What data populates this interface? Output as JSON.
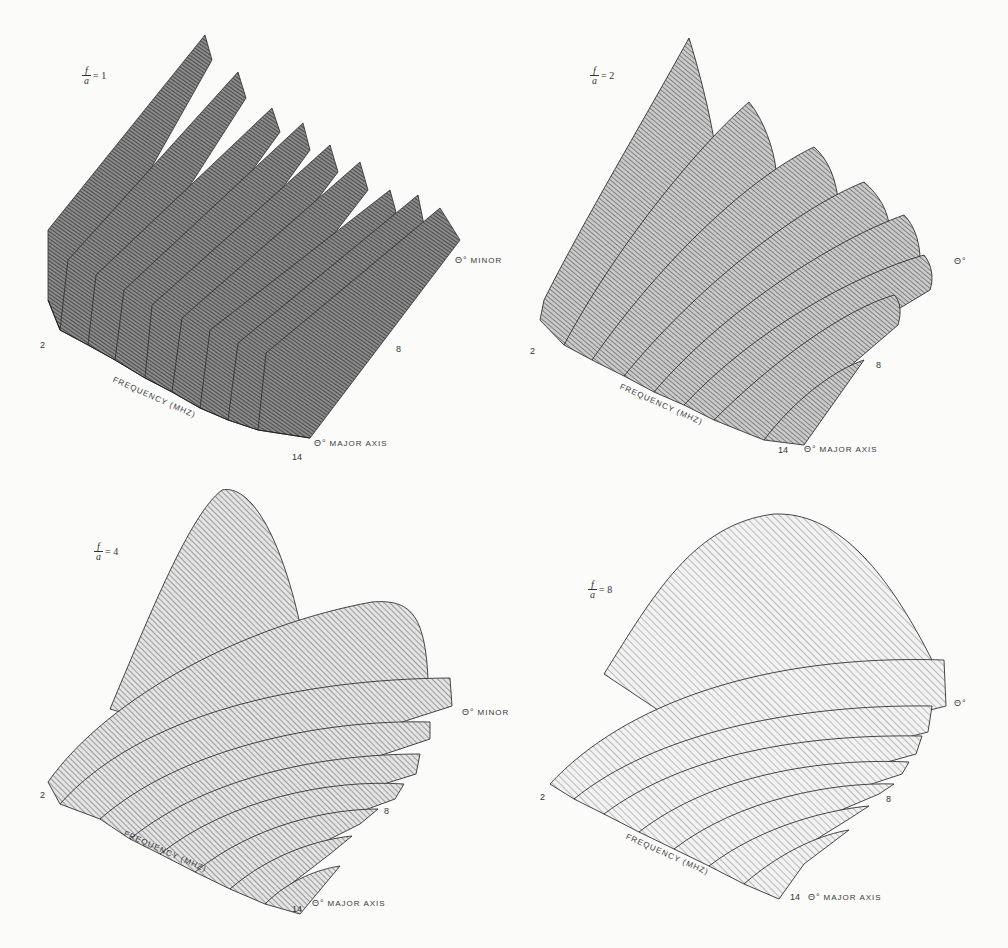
{
  "figure": {
    "panels": [
      {
        "id": "p1",
        "ratio_symbol_num": "f",
        "ratio_symbol_den": "a",
        "ratio_value": "= 1",
        "freq_axis_label": "Frequency (MHz)",
        "freq_ticks": [
          "2",
          "8",
          "14"
        ],
        "angle_axis_minor_symbol": "θ°",
        "angle_axis_minor_label": "Minor",
        "angle_axis_major_symbol": "θ°",
        "angle_axis_major_label": "Major Axis",
        "ridges": 9,
        "shape": "uniform ridges"
      },
      {
        "id": "p2",
        "ratio_symbol_num": "f",
        "ratio_symbol_den": "a",
        "ratio_value": "= 2",
        "freq_axis_label": "Frequency (MHz)",
        "freq_ticks": [
          "2",
          "8",
          "14"
        ],
        "angle_axis_minor_symbol": "θ°",
        "angle_axis_minor_label": "",
        "angle_axis_major_symbol": "θ°",
        "angle_axis_major_label": "Major Axis",
        "ridges": 7,
        "shape": "tall first lobe, decaying ridges"
      },
      {
        "id": "p3",
        "ratio_symbol_num": "f",
        "ratio_symbol_den": "a",
        "ratio_value": "= 4",
        "freq_axis_label": "Frequency (MHz)",
        "freq_ticks": [
          "2",
          "8",
          "14"
        ],
        "angle_axis_minor_symbol": "θ°",
        "angle_axis_minor_label": "Minor",
        "angle_axis_major_symbol": "θ°",
        "angle_axis_major_label": "Major Axis",
        "ridges": 7,
        "shape": "dominant main lobe with sidelobe ridges"
      },
      {
        "id": "p4",
        "ratio_symbol_num": "f",
        "ratio_symbol_den": "a",
        "ratio_value": "= 8",
        "freq_axis_label": "Frequency (MHz)",
        "freq_ticks": [
          "2",
          "8",
          "14"
        ],
        "angle_axis_minor_symbol": "θ°",
        "angle_axis_minor_label": "",
        "angle_axis_major_symbol": "θ°",
        "angle_axis_major_label": "Major Axis",
        "ridges": 7,
        "shape": "broad main lobe with small sidelobes"
      }
    ]
  }
}
